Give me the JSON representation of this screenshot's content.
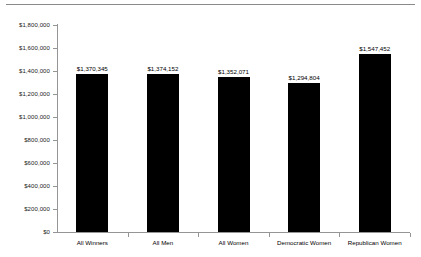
{
  "chart_data": {
    "type": "bar",
    "title": "",
    "subtitle": "",
    "xlabel": "",
    "ylabel": "",
    "categories": [
      "All Winners",
      "All Men",
      "All Women",
      "Democratic Women",
      "Republican Women"
    ],
    "values": [
      1370345,
      1374152,
      1352071,
      1294804,
      1547452
    ],
    "value_labels": [
      "$1,370,345",
      "$1,374,152",
      "$1,352,071",
      "$1,294,804",
      "$1,547,452"
    ],
    "ylim": [
      0,
      1800000
    ],
    "ytick_values": [
      0,
      200000,
      400000,
      600000,
      800000,
      1000000,
      1200000,
      1400000,
      1600000,
      1800000
    ],
    "ytick_labels": [
      "$0",
      "$200,000",
      "$400,000",
      "$600,000",
      "$800,000",
      "$1,000,000",
      "$1,200,000",
      "$1,400,000",
      "$1,600,000",
      "$1,800,000"
    ],
    "grid": false,
    "legend": false,
    "legend_position": "none",
    "bar_color": "#000000",
    "axis_color": "#959595",
    "background_color": "#ffffff",
    "data_labels_shown": true
  },
  "decor": {
    "rule_color": "#8a8a8a"
  }
}
